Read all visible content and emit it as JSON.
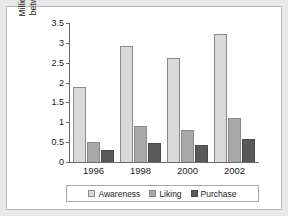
{
  "chart_data": {
    "type": "bar",
    "title": "",
    "xlabel": "",
    "ylabel_lines": [
      "Million women aged",
      "between 14 and 64"
    ],
    "ylabel": "Million women aged between 14 and 64",
    "categories": [
      "1996",
      "1998",
      "2000",
      "2002"
    ],
    "series": [
      {
        "name": "Awareness",
        "color": "#d9d9d9",
        "values": [
          1.88,
          2.93,
          2.62,
          3.22
        ]
      },
      {
        "name": "Liking",
        "color": "#a8a8a8",
        "values": [
          0.51,
          0.9,
          0.8,
          1.12
        ]
      },
      {
        "name": "Purchase",
        "color": "#595959",
        "values": [
          0.31,
          0.48,
          0.43,
          0.58
        ]
      }
    ],
    "ylim": [
      0,
      3.5
    ],
    "yticks": [
      "0",
      "0.5",
      "1",
      "1.5",
      "2",
      "2.5",
      "3",
      "3.5"
    ],
    "ytick_values": [
      0,
      0.5,
      1,
      1.5,
      2,
      2.5,
      3,
      3.5
    ],
    "grid": false,
    "legend_position": "bottom"
  },
  "legend": {
    "items": [
      {
        "label": "Awareness",
        "key": "awareness"
      },
      {
        "label": "Liking",
        "key": "liking"
      },
      {
        "label": "Purchase",
        "key": "purchase"
      }
    ]
  },
  "colors": {
    "awareness": "#d9d9d9",
    "liking": "#a8a8a8",
    "purchase": "#595959",
    "axis": "#6b6b6b",
    "page_background": "#e8e8e8",
    "panel_background": "#ffffff"
  }
}
